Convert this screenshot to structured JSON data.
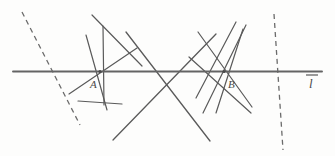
{
  "figure": {
    "background_color": "#fdfdfc",
    "stroke_color": "#5a5a5a",
    "baseline_color": "#646464",
    "dashed_color": "#6b6b6b"
  },
  "labels": {
    "point_a": "A",
    "point_b": "B",
    "line_l": "l",
    "line_l_has_overbar": true
  },
  "points": {
    "a": {
      "label": "A",
      "x": 100,
      "y": 71.5
    },
    "b": {
      "label": "B",
      "x": 224,
      "y": 71.5
    }
  },
  "baseline": {
    "name": "line-l",
    "x1": 13,
    "y1": 71.5,
    "x2": 322,
    "y2": 71.5,
    "width": 1.8
  },
  "label_positions": {
    "a": {
      "x": 90,
      "y": 88
    },
    "b": {
      "x": 228,
      "y": 88
    },
    "l": {
      "x": 308,
      "y": 87
    },
    "l_bar": {
      "x1": 306,
      "y1": 75,
      "x2": 318,
      "y2": 75
    }
  },
  "lines_through_a": [
    {
      "name": "a-line-1",
      "x1": 86,
      "y1": 35,
      "x2": 107,
      "y2": 110
    },
    {
      "name": "a-line-2",
      "x1": 103,
      "y1": 26,
      "x2": 104,
      "y2": 105
    },
    {
      "name": "a-line-3",
      "x1": 69,
      "y1": 94,
      "x2": 137,
      "y2": 48
    },
    {
      "name": "a-line-4",
      "x1": 78,
      "y1": 101,
      "x2": 122,
      "y2": 104
    },
    {
      "name": "a-line-5",
      "x1": 92,
      "y1": 15,
      "x2": 142,
      "y2": 66
    }
  ],
  "lines_through_b": [
    {
      "name": "b-line-1",
      "x1": 196,
      "y1": 98,
      "x2": 236,
      "y2": 22
    },
    {
      "name": "b-line-2",
      "x1": 203,
      "y1": 113,
      "x2": 246,
      "y2": 25
    },
    {
      "name": "b-line-3",
      "x1": 189,
      "y1": 57,
      "x2": 251,
      "y2": 113
    },
    {
      "name": "b-line-4",
      "x1": 216,
      "y1": 113,
      "x2": 243,
      "y2": 29
    },
    {
      "name": "b-line-5",
      "x1": 198,
      "y1": 32,
      "x2": 252,
      "y2": 107
    }
  ],
  "crossing_lines": [
    {
      "name": "cross-line-1",
      "x1": 113,
      "y1": 140,
      "x2": 216,
      "y2": 34
    },
    {
      "name": "cross-line-2",
      "x1": 126,
      "y1": 32,
      "x2": 210,
      "y2": 141
    }
  ],
  "dashed_lines": [
    {
      "name": "dashed-line-left",
      "x1": 22,
      "y1": 12,
      "x2": 80,
      "y2": 125,
      "dash": "5 4"
    },
    {
      "name": "dashed-line-right",
      "x1": 274,
      "y1": 14,
      "x2": 283,
      "y2": 150,
      "dash": "5 4"
    }
  ]
}
